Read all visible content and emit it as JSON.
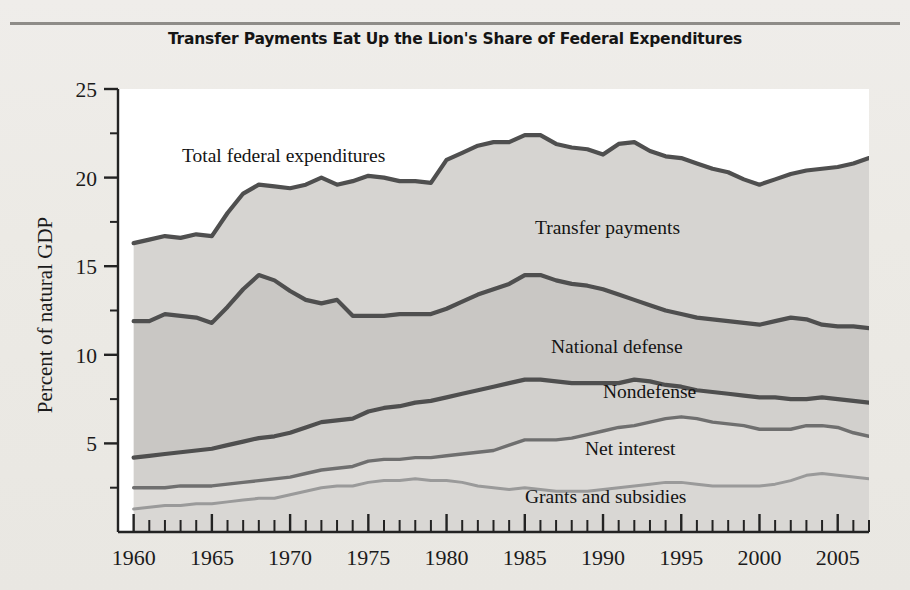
{
  "figure": {
    "title": "Transfer Payments Eat Up the Lion's Share of Federal Expenditures"
  },
  "axes": {
    "ylabel": "Percent of natural GDP",
    "yticks": [
      "5",
      "10",
      "15",
      "20",
      "25"
    ],
    "xticks": [
      "1960",
      "1965",
      "1970",
      "1975",
      "1980",
      "1985",
      "1990",
      "1995",
      "2000",
      "2005"
    ]
  },
  "labels": {
    "total": "Total federal expenditures",
    "transfer": "Transfer payments",
    "defense": "National defense",
    "nondefense": "Nondefense",
    "interest": "Net interest",
    "grants": "Grants and subsidies"
  },
  "colors": {
    "background": "#eceae6",
    "plot_background": "#ffffff",
    "band_transfer": "#d6d4d1",
    "band_defense": "#c9c7c4",
    "band_nondefense": "#d2d0cd",
    "band_interest": "#dddbd8",
    "band_grants": "#d9d7d4",
    "line_dark": "#4f4f4f",
    "line_mid": "#6f6f6f",
    "line_light": "#9a9a9a",
    "axis": "#232323",
    "rule": "#8e8c88"
  },
  "chart_data": {
    "type": "area",
    "title": "Transfer Payments Eat Up the Lion's Share of Federal Expenditures",
    "xlabel": "",
    "ylabel": "Percent of natural GDP",
    "xlim": [
      1959,
      2007
    ],
    "ylim": [
      0,
      25
    ],
    "grid": false,
    "legend": "inline-labels",
    "stacked": true,
    "note": "Cumulative boundary lines; each series value is the cumulative top of its band.",
    "x": [
      1960,
      1961,
      1962,
      1963,
      1964,
      1965,
      1966,
      1967,
      1968,
      1969,
      1970,
      1971,
      1972,
      1973,
      1974,
      1975,
      1976,
      1977,
      1978,
      1979,
      1980,
      1981,
      1982,
      1983,
      1984,
      1985,
      1986,
      1987,
      1988,
      1989,
      1990,
      1991,
      1992,
      1993,
      1994,
      1995,
      1996,
      1997,
      1998,
      1999,
      2000,
      2001,
      2002,
      2003,
      2004,
      2005,
      2006,
      2007
    ],
    "series": [
      {
        "name": "Grants and subsidies",
        "values": [
          1.3,
          1.4,
          1.5,
          1.5,
          1.6,
          1.6,
          1.7,
          1.8,
          1.9,
          1.9,
          2.1,
          2.3,
          2.5,
          2.6,
          2.6,
          2.8,
          2.9,
          2.9,
          3.0,
          2.9,
          2.9,
          2.8,
          2.6,
          2.5,
          2.4,
          2.5,
          2.4,
          2.3,
          2.3,
          2.3,
          2.4,
          2.5,
          2.6,
          2.7,
          2.8,
          2.8,
          2.7,
          2.6,
          2.6,
          2.6,
          2.6,
          2.7,
          2.9,
          3.2,
          3.3,
          3.2,
          3.1,
          3.0
        ]
      },
      {
        "name": "Net interest",
        "values": [
          2.5,
          2.5,
          2.5,
          2.6,
          2.6,
          2.6,
          2.7,
          2.8,
          2.9,
          3.0,
          3.1,
          3.3,
          3.5,
          3.6,
          3.7,
          4.0,
          4.1,
          4.1,
          4.2,
          4.2,
          4.3,
          4.4,
          4.5,
          4.6,
          4.9,
          5.2,
          5.2,
          5.2,
          5.3,
          5.5,
          5.7,
          5.9,
          6.0,
          6.2,
          6.4,
          6.5,
          6.4,
          6.2,
          6.1,
          6.0,
          5.8,
          5.8,
          5.8,
          6.0,
          6.0,
          5.9,
          5.6,
          5.4
        ]
      },
      {
        "name": "Nondefense",
        "values": [
          4.2,
          4.3,
          4.4,
          4.5,
          4.6,
          4.7,
          4.9,
          5.1,
          5.3,
          5.4,
          5.6,
          5.9,
          6.2,
          6.3,
          6.4,
          6.8,
          7.0,
          7.1,
          7.3,
          7.4,
          7.6,
          7.8,
          8.0,
          8.2,
          8.4,
          8.6,
          8.6,
          8.5,
          8.4,
          8.4,
          8.4,
          8.4,
          8.6,
          8.5,
          8.3,
          8.2,
          8.0,
          7.9,
          7.8,
          7.7,
          7.6,
          7.6,
          7.5,
          7.5,
          7.6,
          7.5,
          7.4,
          7.3
        ]
      },
      {
        "name": "National defense",
        "values": [
          11.9,
          11.9,
          12.3,
          12.2,
          12.1,
          11.8,
          12.7,
          13.7,
          14.5,
          14.2,
          13.6,
          13.1,
          12.9,
          13.1,
          12.2,
          12.2,
          12.2,
          12.3,
          12.3,
          12.3,
          12.6,
          13.0,
          13.4,
          13.7,
          14.0,
          14.5,
          14.5,
          14.2,
          14.0,
          13.9,
          13.7,
          13.4,
          13.1,
          12.8,
          12.5,
          12.3,
          12.1,
          12.0,
          11.9,
          11.8,
          11.7,
          11.9,
          12.1,
          12.0,
          11.7,
          11.6,
          11.6,
          11.5
        ]
      },
      {
        "name": "Transfer payments",
        "values": [
          16.3,
          16.5,
          16.7,
          16.6,
          16.8,
          16.7,
          18.0,
          19.1,
          19.6,
          19.5,
          19.4,
          19.6,
          20.0,
          19.6,
          19.8,
          20.1,
          20.0,
          19.8,
          19.8,
          19.7,
          21.0,
          21.4,
          21.8,
          22.0,
          22.0,
          22.4,
          22.4,
          21.9,
          21.7,
          21.6,
          21.3,
          21.9,
          22.0,
          21.5,
          21.2,
          21.1,
          20.8,
          20.5,
          20.3,
          19.9,
          19.6,
          19.9,
          20.2,
          20.4,
          20.5,
          20.6,
          20.8,
          21.1
        ]
      }
    ],
    "top_boundary_name": "Total federal expenditures"
  }
}
